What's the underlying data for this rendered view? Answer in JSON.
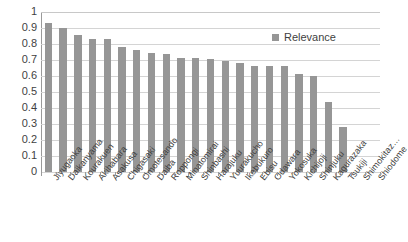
{
  "chart_data": {
    "type": "bar",
    "title": "",
    "subtitle": "",
    "xlabel": "",
    "ylabel": "",
    "ylim": [
      0,
      1
    ],
    "ytick_step": 0.1,
    "ytick_labels": [
      "1",
      "0.9",
      "0.8",
      "0.7",
      "0.6",
      "0.5",
      "0.4",
      "0.3",
      "0.2",
      "0.1",
      "0"
    ],
    "grid": "horizontal",
    "legend_position": "top-right-inside",
    "bar_color": "#969696",
    "gridline_color": "#d4d4d4",
    "axis_color": "#9a9a9a",
    "text_color": "#3f3f3f",
    "background": "#ffffff",
    "legend": [
      "Relevance"
    ],
    "categories": [
      "Jiyugaoka",
      "Daikanyama",
      "Kourakuen",
      "Akihabara",
      "Asakusa",
      "Chigasaki",
      "Omotesando",
      "Daiba",
      "Roppongi",
      "Minatomirai",
      "Shinbashi",
      "Harajuku",
      "Yuurakucho",
      "Ikebukuro",
      "Ebisu",
      "Odawara",
      "Yokosuka",
      "Kichijoji",
      "Shinjuku",
      "Kagurazaka",
      "Tsukiji",
      "Shimokitaz…",
      "Shiodome"
    ],
    "series": [
      {
        "name": "Relevance",
        "values": [
          0.93,
          0.9,
          0.855,
          0.83,
          0.83,
          0.78,
          0.765,
          0.745,
          0.735,
          0.71,
          0.71,
          0.705,
          0.695,
          0.68,
          0.665,
          0.665,
          0.66,
          0.61,
          0.6,
          0.44,
          0.28,
          0,
          0
        ]
      }
    ]
  },
  "legend": {
    "label": "Relevance",
    "swatch_name": "legend-color-swatch"
  }
}
